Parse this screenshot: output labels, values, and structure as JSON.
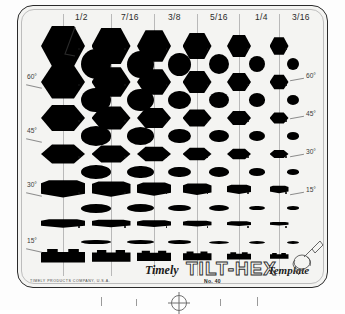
{
  "product": {
    "brand_script": "Timely",
    "logo": "TILT-HEX",
    "type_script": "Template",
    "part_number": "No. 40",
    "manufacturer": "TIMELY PRODUCTS COMPANY, U.S.A."
  },
  "colors": {
    "card": "#f4f4f2",
    "card_border": "#2b2b2b",
    "cutout": "#000000",
    "rule": "#b9b9b9",
    "label": "#2a2a2a",
    "page": "#ffffff"
  },
  "size_columns": [
    {
      "label": "1/2",
      "cx": 62,
      "label_x": 74,
      "hex_w": 44,
      "circle_d": 30
    },
    {
      "label": "7/16",
      "cx": 110,
      "label_x": 122,
      "hex_w": 39,
      "circle_d": 27
    },
    {
      "label": "3/8",
      "cx": 153,
      "label_x": 164,
      "hex_w": 34,
      "circle_d": 23
    },
    {
      "label": "5/16",
      "cx": 196,
      "label_x": 207,
      "hex_w": 29,
      "circle_d": 20
    },
    {
      "label": "1/4",
      "cx": 238,
      "label_x": 248,
      "hex_w": 24,
      "circle_d": 16
    },
    {
      "label": "3/16",
      "cx": 278,
      "label_x": 288,
      "hex_w": 19,
      "circle_d": 12
    }
  ],
  "angle_labels_left": [
    {
      "text": "60°",
      "y": 73
    },
    {
      "text": "45°",
      "y": 127
    },
    {
      "text": "30°",
      "y": 181
    },
    {
      "text": "15°",
      "y": 237
    }
  ],
  "angle_labels_right": [
    {
      "text": "60°",
      "y": 72
    },
    {
      "text": "45°",
      "y": 110
    },
    {
      "text": "30°",
      "y": 148
    },
    {
      "text": "15°",
      "y": 186
    }
  ],
  "tilt_rows": [
    {
      "angle": "90",
      "tilt": 1.0
    },
    {
      "angle": "75",
      "tilt": 0.82
    },
    {
      "angle": "60",
      "tilt": 0.64
    },
    {
      "angle": "45",
      "tilt": 0.47
    },
    {
      "angle": "30",
      "tilt": 0.3
    },
    {
      "angle": "15",
      "tilt": 0.15
    },
    {
      "angle": "0",
      "tilt": 0.05
    }
  ],
  "ruler": {
    "tick_count": 4,
    "target_symbol": "crosshair"
  },
  "hand_icon": "hand-holding-pen-icon"
}
